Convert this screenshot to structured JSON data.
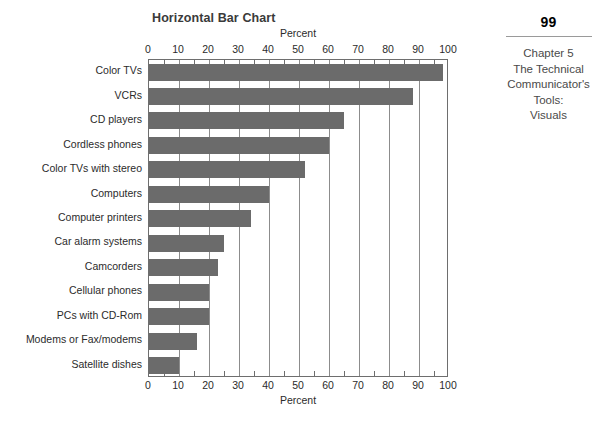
{
  "margin": {
    "page_number": "99",
    "running_head_lines": [
      "Chapter 5",
      "The Technical",
      "Communicator's",
      "Tools:",
      "Visuals"
    ]
  },
  "chart_data": {
    "type": "bar",
    "orientation": "horizontal",
    "title": "Horizontal Bar Chart",
    "xlabel": "Percent",
    "ylabel": "",
    "axis_title_top": "Percent",
    "axis_title_bottom": "Percent",
    "xlim": [
      0,
      100
    ],
    "xticks": [
      0,
      10,
      20,
      30,
      40,
      50,
      60,
      70,
      80,
      90,
      100
    ],
    "xtick_labels": [
      "0",
      "10",
      "20",
      "30",
      "40",
      "50",
      "60",
      "70",
      "80",
      "90",
      "100"
    ],
    "minor_tick_step": 5,
    "grid": "vertical",
    "legend": null,
    "bar_color": "#6b6b6b",
    "categories": [
      "Color TVs",
      "VCRs",
      "CD players",
      "Cordless phones",
      "Color TVs with stereo",
      "Computers",
      "Computer printers",
      "Car alarm systems",
      "Camcorders",
      "Cellular phones",
      "PCs with CD-Rom",
      "Modems or Fax/modems",
      "Satellite dishes"
    ],
    "values": [
      98,
      88,
      65,
      60,
      52,
      40,
      34,
      25,
      23,
      20,
      20,
      16,
      10
    ]
  }
}
